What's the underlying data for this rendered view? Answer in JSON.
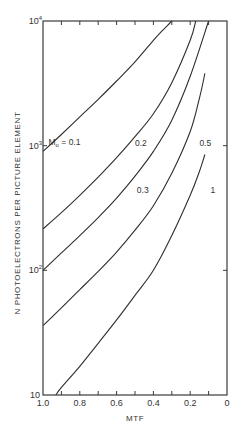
{
  "chart_data": {
    "type": "line",
    "title": "",
    "xlabel": "MTF",
    "ylabel": "N PHOTOELECTRONS PER PICTURE ELEMENT",
    "xlim": [
      1.0,
      0
    ],
    "ylim": [
      10,
      10000
    ],
    "yscale": "log",
    "x_reversed": true,
    "grid": false,
    "legend": "inline curve labels",
    "x_ticks": [
      1.0,
      0.9,
      0.8,
      0.7,
      0.6,
      0.5,
      0.4,
      0.3,
      0.2,
      0.1,
      0
    ],
    "x_tick_labels": [
      "1.0",
      "0.8",
      "0.6",
      "0.4",
      "0.2",
      "0"
    ],
    "x_tick_label_values": [
      1.0,
      0.8,
      0.6,
      0.4,
      0.2,
      0
    ],
    "y_ticks": [
      10,
      100,
      1000,
      10000
    ],
    "y_tick_labels": [
      {
        "base": "10",
        "exp": ""
      },
      {
        "base": "10",
        "exp": "2"
      },
      {
        "base": "10",
        "exp": "3"
      },
      {
        "base": "10",
        "exp": "4"
      }
    ],
    "series": [
      {
        "name": "M0 = 0.1",
        "label": "Mo = 0.1",
        "label_pos": [
          0.97,
          1010
        ],
        "x": [
          1.0,
          0.9,
          0.8,
          0.7,
          0.6,
          0.5,
          0.4,
          0.35,
          0.3
        ],
        "y": [
          900,
          1230,
          1700,
          2350,
          3300,
          4700,
          7000,
          8400,
          10000
        ]
      },
      {
        "name": "0.2",
        "label": "0.2",
        "label_pos": [
          0.5,
          1000
        ],
        "x": [
          1.0,
          0.9,
          0.8,
          0.7,
          0.6,
          0.5,
          0.4,
          0.3,
          0.2,
          0.17
        ],
        "y": [
          215,
          290,
          400,
          560,
          800,
          1180,
          1800,
          3200,
          7000,
          10000
        ]
      },
      {
        "name": "0.3",
        "label": "0.3",
        "label_pos": [
          0.49,
          420
        ],
        "x": [
          1.0,
          0.9,
          0.8,
          0.7,
          0.6,
          0.5,
          0.4,
          0.3,
          0.2,
          0.1
        ],
        "y": [
          100,
          138,
          190,
          265,
          380,
          570,
          900,
          1600,
          3600,
          10000
        ]
      },
      {
        "name": "0.5",
        "label": "0.5",
        "label_pos": [
          0.15,
          1000
        ],
        "x": [
          1.0,
          0.9,
          0.8,
          0.7,
          0.6,
          0.5,
          0.4,
          0.3,
          0.2,
          0.15,
          0.12
        ],
        "y": [
          36,
          50,
          70,
          98,
          140,
          210,
          330,
          600,
          1300,
          2400,
          3800
        ]
      },
      {
        "name": "1",
        "label": "1",
        "label_pos": [
          0.09,
          420
        ],
        "x": [
          0.93,
          0.9,
          0.8,
          0.7,
          0.6,
          0.5,
          0.4,
          0.3,
          0.2,
          0.15,
          0.12
        ],
        "y": [
          10,
          11.5,
          17,
          26,
          40,
          63,
          100,
          190,
          400,
          620,
          850
        ]
      }
    ]
  }
}
